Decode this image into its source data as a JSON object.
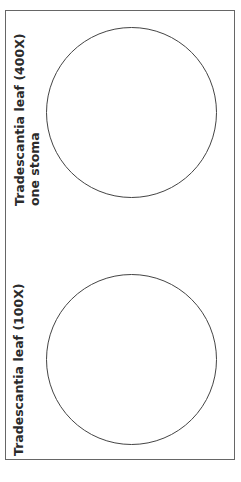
{
  "panels": [
    {
      "title": "Tradescantia leaf (400X)",
      "subtitle": "one stoma"
    },
    {
      "title": "Tradescantia leaf (100X)",
      "subtitle": ""
    }
  ],
  "colors": {
    "border": "#666666",
    "circle": "#444444",
    "text": "#2b2b2b"
  }
}
